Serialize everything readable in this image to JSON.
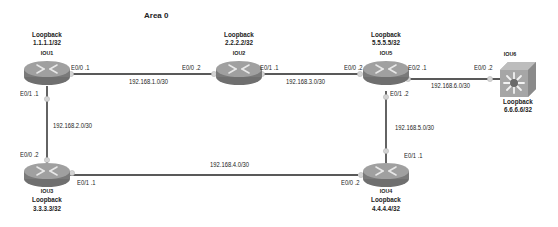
{
  "diagram": {
    "title": "Area 0",
    "nodes": [
      {
        "id": "IOU1",
        "type": "router",
        "name": "IOU1",
        "loopback_label": "Loopback",
        "loopback": "1.1.1.1/32"
      },
      {
        "id": "IOU2",
        "type": "router",
        "name": "IOU2",
        "loopback_label": "Loopback",
        "loopback": "2.2.2.2/32"
      },
      {
        "id": "IOU3",
        "type": "router",
        "name": "IOU3",
        "loopback_label": "Loopback",
        "loopback": "3.3.3.3/32"
      },
      {
        "id": "IOU4",
        "type": "router",
        "name": "IOU4",
        "loopback_label": "Loopback",
        "loopback": "4.4.4.4/32"
      },
      {
        "id": "IOU5",
        "type": "router",
        "name": "IOU5",
        "loopback_label": "Loopback",
        "loopback": "5.5.5.5/32"
      },
      {
        "id": "IOU6",
        "type": "switch",
        "name": "IOU6",
        "loopback_label": "Loopback",
        "loopback": "6.6.6.6/32"
      }
    ],
    "links": [
      {
        "from": "IOU1",
        "to": "IOU2",
        "subnet": "192.168.1.0/30",
        "from_if": "E0/0 .1",
        "to_if": "E0/0 .2"
      },
      {
        "from": "IOU1",
        "to": "IOU3",
        "subnet": "192.168.2.0/30",
        "from_if": "E0/1 .1",
        "to_if": "E0/0 .2"
      },
      {
        "from": "IOU2",
        "to": "IOU5",
        "subnet": "192.168.3.0/30",
        "from_if": "E0/1 .1",
        "to_if": "E0/0 .2"
      },
      {
        "from": "IOU3",
        "to": "IOU4",
        "subnet": "192.168.4.0/30",
        "from_if": "E0/1 .1",
        "to_if": "E0/0 .2"
      },
      {
        "from": "IOU5",
        "to": "IOU4",
        "subnet": "192.168.5.0/30",
        "from_if": "E0/1 .2",
        "to_if": "E0/1 .1"
      },
      {
        "from": "IOU5",
        "to": "IOU6",
        "subnet": "192.168.6.0/30",
        "from_if": "E0/2 .1",
        "to_if": "E0/0 .2"
      }
    ]
  },
  "colors": {
    "router_top": "#9a9a9a",
    "router_side": "#7a7a7a",
    "switch_body": "#a8a8a8",
    "link": "#222222",
    "port_dot": "#cfcfcf"
  }
}
